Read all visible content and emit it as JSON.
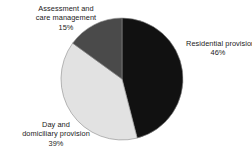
{
  "chart_data": {
    "type": "pie",
    "title": "",
    "categories": [
      "Residential provision",
      "Day and domiciliary provision",
      "Assessment and care management"
    ],
    "values": [
      46,
      39,
      15
    ],
    "value_labels": [
      "46%",
      "39%",
      "15%"
    ],
    "unit": "%",
    "start_angle_deg": 0,
    "direction": "clockwise",
    "legend": "none",
    "grid": false,
    "slices": [
      {
        "name": "Residential provision",
        "value": 46,
        "value_label": "46%",
        "color": "#111111",
        "start_deg": 0,
        "end_deg": 165.6
      },
      {
        "name": "Day and domiciliary provision",
        "value": 39,
        "value_label": "39%",
        "color": "#e2e2e2",
        "start_deg": 165.6,
        "end_deg": 306.0
      },
      {
        "name": "Assessment and care management",
        "value": 15,
        "value_label": "15%",
        "color": "#4a4a4a",
        "start_deg": 306.0,
        "end_deg": 360
      }
    ]
  },
  "labels": {
    "assessment": {
      "line1": "Assessment and",
      "line2": "care management",
      "percent": "15%"
    },
    "residential": {
      "line1": "Residential provision",
      "percent": "46%"
    },
    "day": {
      "line1": "Day and",
      "line2": "domiciliary provision",
      "percent": "39%"
    }
  },
  "colors": {
    "background": "#ffffff",
    "residential": "#111111",
    "day": "#e2e2e2",
    "assessment": "#4a4a4a",
    "outline": "#8a8a8a",
    "text": "#1a1a1a"
  }
}
